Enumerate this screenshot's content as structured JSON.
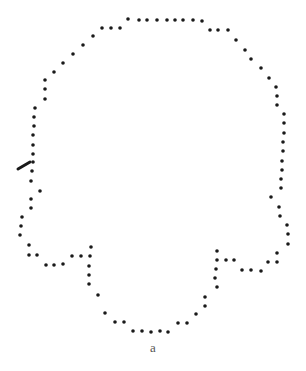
{
  "figure": {
    "caption": "a",
    "dot_color": "#1a1a1a",
    "dot_radius": 1.8,
    "marker_stroke": {
      "x1": 18,
      "y1": 169,
      "x2": 30,
      "y2": 162,
      "color": "#1a1a1a"
    },
    "dots": [
      [
        128,
        19
      ],
      [
        139,
        20
      ],
      [
        147,
        20
      ],
      [
        157,
        20
      ],
      [
        167,
        20
      ],
      [
        175,
        20
      ],
      [
        183,
        20
      ],
      [
        193,
        20
      ],
      [
        202,
        21
      ],
      [
        210,
        30
      ],
      [
        218,
        30
      ],
      [
        228,
        30
      ],
      [
        236,
        40
      ],
      [
        245,
        50
      ],
      [
        251,
        59
      ],
      [
        261,
        68
      ],
      [
        269,
        78
      ],
      [
        276,
        87
      ],
      [
        277,
        96
      ],
      [
        277,
        105
      ],
      [
        284,
        114
      ],
      [
        284,
        123
      ],
      [
        284,
        133
      ],
      [
        283,
        142
      ],
      [
        283,
        151
      ],
      [
        282,
        161
      ],
      [
        282,
        170
      ],
      [
        281,
        179
      ],
      [
        281,
        188
      ],
      [
        271,
        197
      ],
      [
        279,
        207
      ],
      [
        280,
        216
      ],
      [
        287,
        225
      ],
      [
        288,
        234
      ],
      [
        288,
        244
      ],
      [
        277,
        253
      ],
      [
        277,
        262
      ],
      [
        268,
        262
      ],
      [
        261,
        271
      ],
      [
        251,
        270
      ],
      [
        242,
        270
      ],
      [
        234,
        260
      ],
      [
        226,
        260
      ],
      [
        217,
        260
      ],
      [
        217,
        251
      ],
      [
        216,
        269
      ],
      [
        215,
        278
      ],
      [
        217,
        287
      ],
      [
        205,
        297
      ],
      [
        205,
        306
      ],
      [
        196,
        314
      ],
      [
        187,
        323
      ],
      [
        178,
        323
      ],
      [
        168,
        332
      ],
      [
        160,
        331
      ],
      [
        151,
        332
      ],
      [
        142,
        331
      ],
      [
        133,
        331
      ],
      [
        124,
        322
      ],
      [
        115,
        322
      ],
      [
        105,
        313
      ],
      [
        98,
        295
      ],
      [
        89,
        284
      ],
      [
        89,
        275
      ],
      [
        89,
        266
      ],
      [
        90,
        256
      ],
      [
        91,
        247
      ],
      [
        81,
        256
      ],
      [
        72,
        256
      ],
      [
        63,
        264
      ],
      [
        54,
        265
      ],
      [
        46,
        265
      ],
      [
        37,
        255
      ],
      [
        29,
        255
      ],
      [
        29,
        245
      ],
      [
        20,
        235
      ],
      [
        21,
        226
      ],
      [
        22,
        217
      ],
      [
        31,
        208
      ],
      [
        31,
        199
      ],
      [
        40,
        191
      ],
      [
        31,
        181
      ],
      [
        32,
        171
      ],
      [
        33,
        162
      ],
      [
        33,
        154
      ],
      [
        33,
        145
      ],
      [
        33,
        135
      ],
      [
        34,
        126
      ],
      [
        34,
        117
      ],
      [
        35,
        108
      ],
      [
        45,
        99
      ],
      [
        45,
        89
      ],
      [
        45,
        80
      ],
      [
        54,
        72
      ],
      [
        63,
        63
      ],
      [
        73,
        54
      ],
      [
        83,
        45
      ],
      [
        93,
        36
      ],
      [
        102,
        28
      ],
      [
        111,
        28
      ],
      [
        120,
        28
      ]
    ]
  }
}
